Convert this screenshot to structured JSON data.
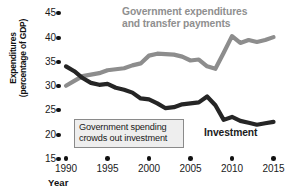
{
  "chart_data": {
    "type": "line",
    "title": "",
    "xlabel": "Year",
    "ylabel": "Expenditures (percentage of GDP)",
    "ylabel_line1": "Expenditures",
    "ylabel_line2": "(percentage of GDP)",
    "xlim": [
      1990,
      2015
    ],
    "ylim": [
      15,
      45
    ],
    "grid": false,
    "legend_position": "inline-annotations",
    "x_ticks": [
      1990,
      1995,
      2000,
      2005,
      2010,
      2015
    ],
    "y_ticks": [
      15,
      20,
      25,
      30,
      35,
      40,
      45
    ],
    "tick_marker": "dot",
    "x": [
      1990,
      1991,
      1992,
      1993,
      1994,
      1995,
      1996,
      1997,
      1998,
      1999,
      2000,
      2001,
      2002,
      2003,
      2004,
      2005,
      2006,
      2007,
      2008,
      2009,
      2010,
      2011,
      2012,
      2013,
      2014,
      2015
    ],
    "series": [
      {
        "name": "Government expenditures and transfer payments",
        "color": "#8d8d8d",
        "label_line1": "Government expenditures",
        "label_line2": "and transfer payments",
        "values": [
          30.0,
          31.0,
          32.0,
          32.3,
          32.6,
          33.2,
          33.4,
          33.6,
          34.2,
          34.6,
          36.2,
          36.6,
          36.5,
          36.4,
          36.0,
          35.2,
          35.4,
          34.0,
          33.5,
          36.8,
          40.2,
          38.8,
          39.4,
          39.0,
          39.4,
          40.0
        ]
      },
      {
        "name": "Investment",
        "color": "#252525",
        "label": "Investment",
        "values": [
          34.0,
          33.0,
          31.6,
          30.6,
          30.2,
          30.4,
          29.6,
          29.2,
          28.6,
          27.4,
          27.2,
          26.4,
          25.4,
          25.6,
          26.2,
          26.4,
          26.6,
          27.8,
          26.0,
          23.0,
          23.6,
          22.8,
          22.4,
          22.0,
          22.3,
          22.6
        ]
      }
    ],
    "annotations": [
      {
        "name": "crowding-out-callout",
        "line1": "Government spending",
        "line2": "crowds out investment"
      }
    ]
  },
  "colors": {
    "gov_line": "#8d8d8d",
    "investment_line": "#252525",
    "callout_border": "#8a8a8a",
    "callout_fill": "#eeeeee",
    "text": "#1a1a1a",
    "background": "#ffffff"
  }
}
